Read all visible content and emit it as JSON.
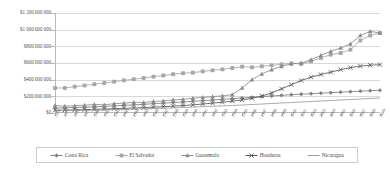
{
  "chart_data": {
    "type": "line",
    "title": "",
    "xlabel": "",
    "ylabel": "",
    "ylim": [
      0,
      1200000000
    ],
    "ytick_labels": [
      "$1 200 000 000",
      "$1 000 000 000",
      "$800 000 000",
      "$600 000 000",
      "$400 000 000",
      "$200 000 000",
      "$0"
    ],
    "ytick_values": [
      1200000000,
      1000000000,
      800000000,
      600000000,
      400000000,
      200000000,
      0
    ],
    "grid": true,
    "legend_position": "bottom",
    "categories": [
      "1976",
      "1977",
      "1978",
      "1979",
      "1980",
      "1981",
      "1982",
      "1983",
      "1984",
      "1985",
      "1986",
      "1987",
      "1988",
      "1989",
      "1990",
      "1991",
      "1992",
      "1993",
      "1994",
      "1995",
      "1996",
      "1997",
      "1998",
      "1999",
      "2000",
      "2001",
      "2002",
      "2003",
      "2004",
      "2005",
      "2006",
      "2007",
      "2008",
      "2009"
    ],
    "series": [
      {
        "name": "Costa Rica",
        "marker": "diamond",
        "color": "#7f7f7f",
        "values": [
          60000000,
          62000000,
          66000000,
          70000000,
          74000000,
          80000000,
          86000000,
          92000000,
          98000000,
          104000000,
          112000000,
          118000000,
          126000000,
          132000000,
          140000000,
          148000000,
          156000000,
          164000000,
          172000000,
          180000000,
          188000000,
          196000000,
          204000000,
          212000000,
          220000000,
          226000000,
          232000000,
          238000000,
          244000000,
          250000000,
          256000000,
          262000000,
          268000000,
          272000000
        ]
      },
      {
        "name": "El Salvador",
        "marker": "square",
        "color": "#a6a6a6",
        "values": [
          300000000,
          300000000,
          316000000,
          330000000,
          346000000,
          360000000,
          376000000,
          392000000,
          406000000,
          420000000,
          436000000,
          450000000,
          466000000,
          478000000,
          484000000,
          500000000,
          512000000,
          524000000,
          540000000,
          556000000,
          548000000,
          560000000,
          572000000,
          584000000,
          596000000,
          588000000,
          620000000,
          660000000,
          700000000,
          720000000,
          760000000,
          870000000,
          930000000,
          960000000
        ]
      },
      {
        "name": "Guatemala",
        "marker": "triangle",
        "color": "#8c8c8c",
        "values": [
          90000000,
          82000000,
          86000000,
          94000000,
          102000000,
          98000000,
          112000000,
          118000000,
          128000000,
          126000000,
          138000000,
          146000000,
          156000000,
          164000000,
          178000000,
          188000000,
          196000000,
          206000000,
          220000000,
          300000000,
          400000000,
          470000000,
          520000000,
          560000000,
          590000000,
          600000000,
          640000000,
          690000000,
          740000000,
          780000000,
          830000000,
          930000000,
          980000000,
          960000000
        ]
      },
      {
        "name": "Honduras",
        "marker": "x",
        "color": "#595959",
        "values": [
          32000000,
          34000000,
          37000000,
          40000000,
          44000000,
          48000000,
          52000000,
          56000000,
          60000000,
          64000000,
          70000000,
          76000000,
          82000000,
          90000000,
          98000000,
          108000000,
          118000000,
          130000000,
          142000000,
          156000000,
          176000000,
          204000000,
          240000000,
          290000000,
          340000000,
          390000000,
          430000000,
          462000000,
          490000000,
          520000000,
          544000000,
          562000000,
          574000000,
          580000000
        ]
      },
      {
        "name": "Nicaragua",
        "marker": "none",
        "color": "#9c9c9c",
        "values": [
          28000000,
          29000000,
          31000000,
          33000000,
          35000000,
          38000000,
          41000000,
          44000000,
          47000000,
          50000000,
          54000000,
          58000000,
          62000000,
          66000000,
          70000000,
          75000000,
          80000000,
          85000000,
          90000000,
          96000000,
          102000000,
          108000000,
          114000000,
          120000000,
          126000000,
          132000000,
          138000000,
          144000000,
          150000000,
          156000000,
          162000000,
          168000000,
          174000000,
          180000000
        ]
      }
    ]
  },
  "legend": {
    "items": [
      {
        "label": "Costa Rica"
      },
      {
        "label": "El Salvador"
      },
      {
        "label": "Guatemala"
      },
      {
        "label": "Honduras"
      },
      {
        "label": "Nicaragua"
      }
    ]
  }
}
